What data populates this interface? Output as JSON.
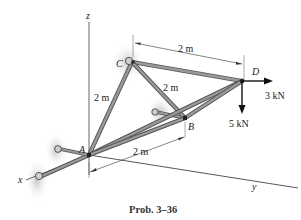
{
  "figure": {
    "caption": "Prob. 3–36",
    "axes": {
      "x": "x",
      "y": "y",
      "z": "z"
    },
    "points": {
      "A": "A",
      "B": "B",
      "C": "C",
      "D": "D"
    },
    "dimensions": {
      "top_CD": "2 m",
      "AC": "2 m",
      "CB": "2 m",
      "AB": "2 m"
    },
    "loads": {
      "horizontal": "3 kN",
      "vertical": "5 kN"
    },
    "colors": {
      "member": "#8a8a8a",
      "member_edge": "#5a5a5a",
      "shadow": "#cfcfcf",
      "axis": "#444444",
      "arrow": "#111111"
    }
  }
}
